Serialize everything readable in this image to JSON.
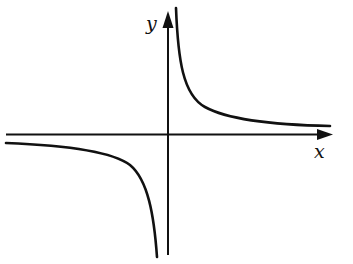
{
  "diagram": {
    "axes": {
      "x_label": "x",
      "y_label": "y"
    },
    "curve": {
      "type": "hyperbola",
      "equation_form": "y = k/x, k > 0",
      "branches": [
        "quadrant I",
        "quadrant III"
      ]
    },
    "colors": {
      "ink": "#111111",
      "background": "#ffffff"
    }
  }
}
